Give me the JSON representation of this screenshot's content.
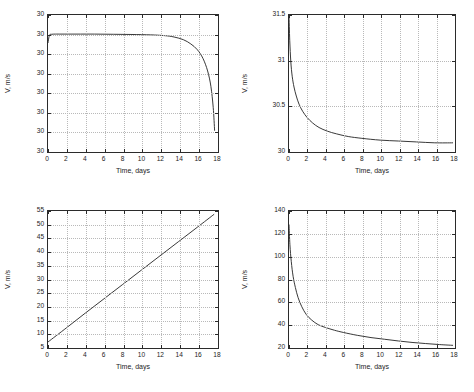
{
  "figure": {
    "type": "multi-panel-line-plot",
    "layout": "2x2",
    "background": "#ffffff",
    "line_color": "#232323",
    "grid_color": "#b9b9b9",
    "axis_color": "#2b2b2b"
  },
  "chart_data": [
    {
      "id": "top-left",
      "type": "line",
      "title": "",
      "xlabel": "Time, days",
      "ylabel": "V, m/s",
      "xlim": [
        0,
        18
      ],
      "ylim": [
        0,
        7
      ],
      "grid": true,
      "legend": null,
      "xticks": [
        0,
        2,
        4,
        6,
        8,
        10,
        12,
        14,
        16,
        18
      ],
      "xticklabels": [
        "0",
        "2",
        "4",
        "6",
        "8",
        "10",
        "12",
        "14",
        "16",
        "18"
      ],
      "yticks": [
        0,
        1,
        2,
        3,
        4,
        5,
        6,
        7
      ],
      "yticklabels": [
        "30",
        "30",
        "30",
        "30",
        "30",
        "30",
        "30",
        "30"
      ],
      "series": [
        {
          "name": "V",
          "x": [
            0,
            0.15,
            0.4,
            0.8,
            1.5,
            3,
            5,
            7,
            9,
            11,
            12.5,
            13.5,
            14.5,
            15.3,
            16,
            16.6,
            17.1,
            17.45,
            17.7,
            17.85
          ],
          "y": [
            5.55,
            5.95,
            6.0,
            6.01,
            6.01,
            6.01,
            6.01,
            6.0,
            5.99,
            5.97,
            5.93,
            5.86,
            5.72,
            5.5,
            5.2,
            4.75,
            4.1,
            3.3,
            2.2,
            1.0
          ]
        }
      ]
    },
    {
      "id": "top-right",
      "type": "line",
      "title": "",
      "xlabel": "Time, days",
      "ylabel": "V, m/s",
      "xlim": [
        0,
        18
      ],
      "ylim": [
        30,
        31.5
      ],
      "grid": true,
      "legend": null,
      "xticks": [
        0,
        2,
        4,
        6,
        8,
        10,
        12,
        14,
        16,
        18
      ],
      "xticklabels": [
        "0",
        "2",
        "4",
        "6",
        "8",
        "10",
        "12",
        "14",
        "16",
        "18"
      ],
      "yticks": [
        30,
        30.5,
        31,
        31.5
      ],
      "yticklabels": [
        "30",
        "30.5",
        "31",
        "31.5"
      ],
      "series": [
        {
          "name": "V",
          "x": [
            0,
            0.08,
            0.2,
            0.35,
            0.55,
            0.8,
            1.1,
            1.5,
            2,
            2.6,
            3.3,
            4.2,
            5.2,
            6.5,
            8,
            10,
            12,
            14,
            16,
            18
          ],
          "y": [
            31.5,
            31.22,
            30.98,
            30.82,
            30.7,
            30.6,
            30.51,
            30.43,
            30.36,
            30.3,
            30.25,
            30.21,
            30.18,
            30.15,
            30.13,
            30.11,
            30.1,
            30.09,
            30.08,
            30.08
          ]
        }
      ]
    },
    {
      "id": "bottom-left",
      "type": "line",
      "title": "",
      "xlabel": "Time, days",
      "ylabel": "V, m/s",
      "xlim": [
        0,
        18
      ],
      "ylim": [
        5,
        55
      ],
      "grid": true,
      "legend": null,
      "xticks": [
        0,
        2,
        4,
        6,
        8,
        10,
        12,
        14,
        16,
        18
      ],
      "xticklabels": [
        "0",
        "2",
        "4",
        "6",
        "8",
        "10",
        "12",
        "14",
        "16",
        "18"
      ],
      "yticks": [
        5,
        10,
        15,
        20,
        25,
        30,
        35,
        40,
        45,
        50,
        55
      ],
      "yticklabels": [
        "5",
        "10",
        "15",
        "20",
        "25",
        "30",
        "35",
        "40",
        "45",
        "50",
        "55"
      ],
      "series": [
        {
          "name": "V",
          "x": [
            0,
            2,
            4,
            6,
            8,
            10,
            12,
            14,
            16,
            17.8
          ],
          "y": [
            6.5,
            11.8,
            17.2,
            22.5,
            27.8,
            33.1,
            38.4,
            43.7,
            49.0,
            53.8
          ]
        }
      ]
    },
    {
      "id": "bottom-right",
      "type": "line",
      "title": "",
      "xlabel": "Time, days",
      "ylabel": "V, m/s",
      "xlim": [
        0,
        18
      ],
      "ylim": [
        20,
        140
      ],
      "grid": true,
      "legend": null,
      "xticks": [
        0,
        2,
        4,
        6,
        8,
        10,
        12,
        14,
        16,
        18
      ],
      "xticklabels": [
        "0",
        "2",
        "4",
        "6",
        "8",
        "10",
        "12",
        "14",
        "16",
        "18"
      ],
      "yticks": [
        20,
        40,
        60,
        80,
        100,
        120,
        140
      ],
      "yticklabels": [
        "20",
        "40",
        "60",
        "80",
        "100",
        "120",
        "140"
      ],
      "series": [
        {
          "name": "V",
          "x": [
            0,
            0.1,
            0.25,
            0.45,
            0.7,
            1.0,
            1.4,
            1.9,
            2.5,
            3.2,
            4,
            5,
            6,
            7.5,
            9,
            10.5,
            12,
            13.5,
            15,
            16.5,
            18
          ],
          "y": [
            128,
            110,
            95,
            82,
            72,
            63,
            55,
            48,
            43,
            39,
            36.5,
            34,
            32,
            29.5,
            27.5,
            26,
            24.5,
            23.2,
            22.2,
            21.3,
            20.6
          ]
        }
      ]
    }
  ]
}
